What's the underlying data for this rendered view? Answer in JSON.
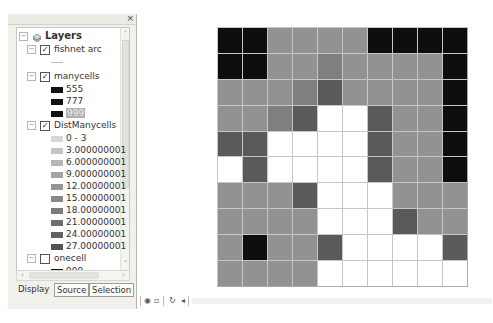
{
  "toc": {
    "close_glyph": "×",
    "root": {
      "label": "Layers",
      "icon": "layers-icon",
      "expander": "−"
    },
    "layers": [
      {
        "name": "fishnet arc",
        "checked": true,
        "expander": "−",
        "legend": [
          {
            "type": "line",
            "label": ""
          }
        ]
      },
      {
        "name": "manycells",
        "checked": true,
        "expander": "−",
        "legend": [
          {
            "type": "swatch",
            "color": "#111111",
            "label": "555"
          },
          {
            "type": "swatch",
            "color": "#111111",
            "label": "777"
          },
          {
            "type": "swatch",
            "color": "#111111",
            "label": "999",
            "selected": true
          }
        ]
      },
      {
        "name": "DistManycells",
        "checked": true,
        "expander": "−",
        "legend": [
          {
            "type": "swatch",
            "color": "#d6d6d6",
            "label": "0 - 3"
          },
          {
            "type": "swatch",
            "color": "#c4c4c4",
            "label": "3.000000001 - 6"
          },
          {
            "type": "swatch",
            "color": "#b5b5b5",
            "label": "6.000000001 - 9"
          },
          {
            "type": "swatch",
            "color": "#a4a4a4",
            "label": "9.000000001 - 1"
          },
          {
            "type": "swatch",
            "color": "#959595",
            "label": "12.00000001 - 1"
          },
          {
            "type": "swatch",
            "color": "#888888",
            "label": "15.00000001 - 1"
          },
          {
            "type": "swatch",
            "color": "#7b7b7b",
            "label": "18.00000001 - 2"
          },
          {
            "type": "swatch",
            "color": "#6e6e6e",
            "label": "21.00000001 - 2"
          },
          {
            "type": "swatch",
            "color": "#616161",
            "label": "24.00000001 - 2"
          },
          {
            "type": "swatch",
            "color": "#545454",
            "label": "27.00000001 - 3"
          }
        ]
      },
      {
        "name": "onecell",
        "checked": false,
        "expander": "−",
        "legend": [
          {
            "type": "swatch",
            "color": "#111111",
            "label": "999"
          }
        ]
      },
      {
        "name": "MapDist1",
        "checked": false,
        "expander": "−",
        "legend": [
          {
            "type": "swatch",
            "color": "#d6d6d6",
            "label": "0 - 11.5122222"
          }
        ]
      }
    ],
    "scroll": {
      "up": "˄",
      "down": "˅",
      "left": "‹",
      "right": "›"
    },
    "tabs": [
      {
        "label": "Display",
        "active": true
      },
      {
        "label": "Source"
      },
      {
        "label": "Selection"
      }
    ]
  },
  "map_toolbar": {
    "icons": [
      {
        "name": "globe-icon",
        "glyph": "◉"
      },
      {
        "name": "page-layout-icon",
        "glyph": "▫"
      },
      {
        "name": "refresh-icon",
        "glyph": "↻"
      },
      {
        "name": "pause-draw-icon",
        "glyph": "◂"
      }
    ]
  },
  "map": {
    "rows": 10,
    "cols": 10,
    "palette": {
      "B": "#0d0d0d",
      "D": "#5a5a5a",
      "M": "#7f7f7f",
      "g": "#929292",
      "W": "#ffffff"
    },
    "cells": [
      "BBggggBBBB",
      "BBggMggggB",
      "gggMDggggB",
      "ggMDWWDggB",
      "DDWWWWDggB",
      "WDWWWWDggB",
      "gggDWWWggg",
      "ggggWWWDgg",
      "gBggDWWWWD",
      "ggggWWWWWW"
    ]
  }
}
